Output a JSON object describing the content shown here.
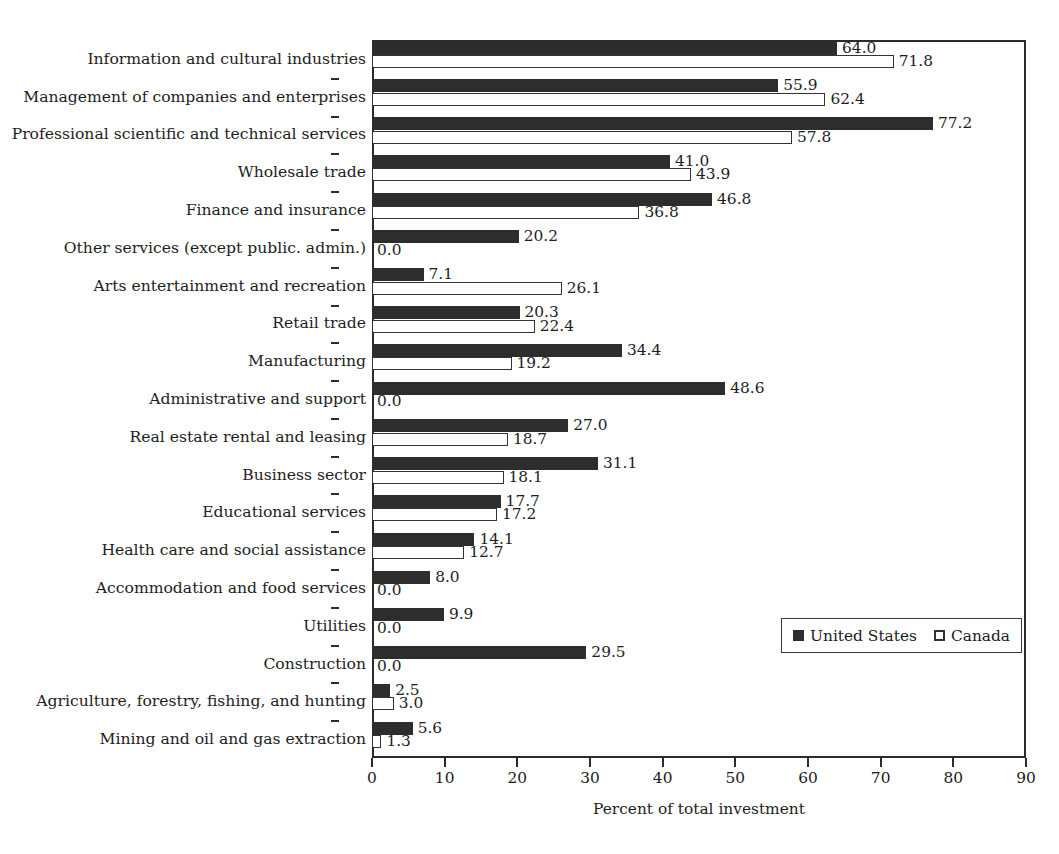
{
  "chart_data": {
    "type": "bar",
    "orientation": "horizontal",
    "title": "",
    "xlabel": "Percent of total investment",
    "ylabel": "",
    "xlim": [
      0,
      90
    ],
    "xticks": [
      0,
      10,
      20,
      30,
      40,
      50,
      60,
      70,
      80,
      90
    ],
    "grid": false,
    "legend_position": "inside-lower-right",
    "categories": [
      "Information and cultural industries",
      "Management of companies and enterprises",
      "Professional scientific and technical services",
      "Wholesale trade",
      "Finance and insurance",
      "Other services (except public. admin.)",
      "Arts entertainment and recreation",
      "Retail trade",
      "Manufacturing",
      "Administrative and support",
      "Real estate rental and leasing",
      "Business sector",
      "Educational services",
      "Health care and social assistance",
      "Accommodation and food services",
      "Utilities",
      "Construction",
      "Agriculture, forestry, fishing, and hunting",
      "Mining and oil and gas extraction"
    ],
    "series": [
      {
        "name": "United States",
        "color": "#2d2d2d",
        "style": "filled",
        "values": [
          64.0,
          55.9,
          77.2,
          41.0,
          46.8,
          20.2,
          7.1,
          20.3,
          34.4,
          48.6,
          27.0,
          31.1,
          17.7,
          14.1,
          8.0,
          9.9,
          29.5,
          2.5,
          5.6
        ],
        "labels": [
          "64.0",
          "55.9",
          "77.2",
          "41.0",
          "46.8",
          "20.2",
          "7.1",
          "20.3",
          "34.4",
          "48.6",
          "27.0",
          "31.1",
          "17.7",
          "14.1",
          "8.0",
          "9.9",
          "29.5",
          "2.5",
          "5.6"
        ]
      },
      {
        "name": "Canada",
        "color": "#ffffff",
        "style": "open",
        "values": [
          71.8,
          62.4,
          57.8,
          43.9,
          36.8,
          0.0,
          26.1,
          22.4,
          19.2,
          0.0,
          18.7,
          18.1,
          17.2,
          12.7,
          0.0,
          0.0,
          0.0,
          3.0,
          1.3
        ],
        "labels": [
          "71.8",
          "62.4",
          "57.8",
          "43.9",
          "36.8",
          "0.0",
          "26.1",
          "22.4",
          "19.2",
          "0.0",
          "18.7",
          "18.1",
          "17.2",
          "12.7",
          "0.0",
          "0.0",
          "0.0",
          "3.0",
          "1.3"
        ]
      }
    ]
  },
  "legend": {
    "items": [
      {
        "label": "United States",
        "swatch": "filled-square-icon"
      },
      {
        "label": "Canada",
        "swatch": "open-square-icon"
      }
    ]
  },
  "axis": {
    "x_title": "Percent of total investment",
    "x_tick_labels": [
      "0",
      "10",
      "20",
      "30",
      "40",
      "50",
      "60",
      "70",
      "80",
      "90"
    ]
  },
  "colors": {
    "united_states": "#2d2d2d",
    "canada": "#ffffff",
    "axis": "#2b2b2b",
    "text": "#1d1d1d",
    "background": "#ffffff"
  }
}
